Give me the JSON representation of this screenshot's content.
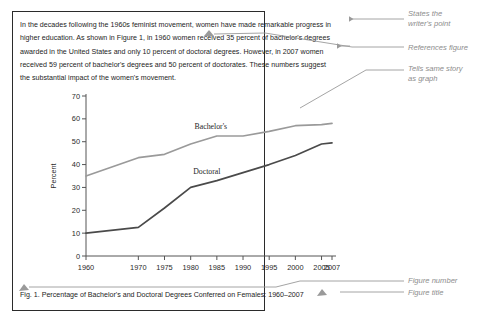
{
  "paragraph": {
    "text": "In the decades following the 1960s feminist movement, women have made remarkable progress in higher education. As shown in Figure 1, in 1960 women received 35 percent of bachelor's degrees awarded in the United States and only 10 percent of doctoral degrees. However, in 2007 women received 59 percent of bachelor's degrees and 50 percent of doctorates. These numbers suggest the substantial impact of the women's movement."
  },
  "caption": {
    "text": "Fig. 1.  Percentage of Bachelor's and Doctoral Degrees Conferred on Females: 1960–2007"
  },
  "annotations": {
    "states_point": "States the\nwriter's point",
    "references_figure": "References figure",
    "tells_same_story": "Tells same story\nas graph",
    "figure_number": "Figure number",
    "figure_title": "Figure title"
  },
  "colors": {
    "bachelors_line": "#9a9a9a",
    "doctoral_line": "#4a4a4a",
    "axis": "#555555",
    "border": "#2b2b2b",
    "annotation_text": "#8d8d8d",
    "body_text": "#1d1d1d"
  },
  "chart_data": {
    "type": "line",
    "title": "",
    "xlabel": "",
    "ylabel": "Percent",
    "ylim": [
      0,
      70
    ],
    "yticks": [
      0,
      10,
      20,
      30,
      40,
      50,
      60,
      70
    ],
    "grid": false,
    "legend": "inline-labels",
    "categories": [
      "1960",
      "1970",
      "1975",
      "1980",
      "1985",
      "1990",
      "1995",
      "2000",
      "2005",
      "2007"
    ],
    "series": [
      {
        "name": "Bachelor's",
        "color": "#9a9a9a",
        "values": [
          35,
          43,
          44.5,
          49,
          52.5,
          52.5,
          54.5,
          57,
          57.5,
          58
        ]
      },
      {
        "name": "Doctoral",
        "color": "#4a4a4a",
        "values": [
          10,
          12.5,
          21,
          30,
          33,
          36.5,
          40,
          44,
          49,
          49.5
        ]
      }
    ],
    "inline_labels": [
      {
        "text": "Bachelor's",
        "series": "Bachelor's"
      },
      {
        "text": "Doctoral",
        "series": "Doctoral"
      }
    ]
  }
}
